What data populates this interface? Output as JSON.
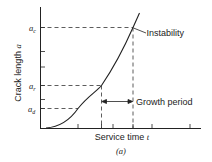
{
  "figure": {
    "caption": "(a)",
    "x_axis": {
      "label": "Service time",
      "symbol": "t"
    },
    "y_axis": {
      "label": "Crack length",
      "symbol": "a"
    },
    "levels": [
      {
        "symbol": "a",
        "subscript": "c",
        "meaning": "critical crack length"
      },
      {
        "symbol": "a",
        "subscript": "r",
        "meaning": "crack length at start of growth period"
      },
      {
        "symbol": "a",
        "subscript": "d",
        "meaning": "detectable crack length"
      }
    ],
    "annotations": {
      "instability": "Instability",
      "growth_period": "Growth period"
    },
    "colors": {
      "line": "#222222",
      "dash": "#333333",
      "background": "#ffffff"
    }
  }
}
